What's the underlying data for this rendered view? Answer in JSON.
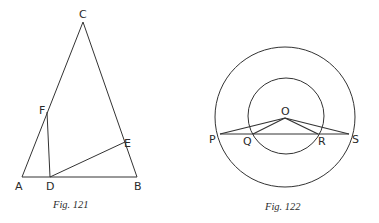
{
  "figures": [
    {
      "caption": "Fig. 121",
      "points": {
        "A": {
          "label": "A",
          "x": 22,
          "y": 177
        },
        "B": {
          "label": "B",
          "x": 137,
          "y": 177
        },
        "C": {
          "label": "C",
          "x": 83,
          "y": 22
        },
        "D": {
          "label": "D",
          "x": 50,
          "y": 177
        },
        "E": {
          "label": "E",
          "x": 125,
          "y": 142
        },
        "F": {
          "label": "F",
          "x": 47,
          "y": 112
        }
      },
      "segments": [
        "AB",
        "AC",
        "BC",
        "DF",
        "DE"
      ]
    },
    {
      "caption": "Fig. 122",
      "center": {
        "label": "O",
        "x": 285,
        "y": 118
      },
      "circles": [
        {
          "name": "outer",
          "cx": 285,
          "cy": 117,
          "r": 70
        },
        {
          "name": "inner",
          "cx": 286,
          "cy": 116,
          "r": 38
        }
      ],
      "points": {
        "P": {
          "label": "P",
          "x": 220,
          "y": 134
        },
        "Q": {
          "label": "Q",
          "x": 253,
          "y": 134
        },
        "R": {
          "label": "R",
          "x": 318,
          "y": 134
        },
        "S": {
          "label": "S",
          "x": 349,
          "y": 134
        }
      },
      "segments": [
        "PS",
        "OP",
        "OQ",
        "OR",
        "OS"
      ]
    }
  ]
}
